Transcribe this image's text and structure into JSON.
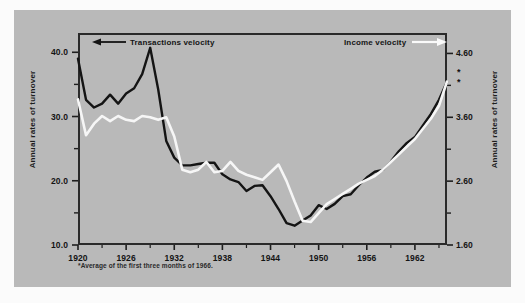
{
  "chart_data": {
    "type": "line",
    "title": "",
    "subtitle": "",
    "xlabel": "",
    "ylabel": "Annual rates of turnover",
    "ylabel_right": "Annual rates of turnover",
    "grid": false,
    "legend_position": "top",
    "xlim": [
      1920,
      1966
    ],
    "xticks": [
      1920,
      1926,
      1932,
      1938,
      1944,
      1950,
      1956,
      1962
    ],
    "xtick_labels": [
      "1920",
      "1926",
      "1932",
      "1938",
      "1944",
      "1950",
      "1956",
      "1962"
    ],
    "ylim_left": [
      10.0,
      43.0
    ],
    "yticks_left": [
      10.0,
      20.0,
      30.0,
      40.0
    ],
    "ytick_labels_left": [
      "10.0",
      "20.0",
      "30.0",
      "40.0"
    ],
    "yminor_left": [
      15.0,
      25.0,
      35.0
    ],
    "ylim_right": [
      1.6,
      4.92
    ],
    "yticks_right": [
      1.6,
      2.6,
      3.6,
      4.6
    ],
    "ytick_labels_right": [
      "1.60",
      "2.60",
      "3.60",
      "4.60"
    ],
    "yminor_right": [
      2.1,
      3.1,
      4.1
    ],
    "footnote": "*Average of the first three months of 1966.",
    "series": [
      {
        "name": "Transactions velocity",
        "color": "#141414",
        "axis": "left",
        "arrow": "left",
        "x": [
          1920,
          1921,
          1922,
          1923,
          1924,
          1925,
          1926,
          1927,
          1928,
          1929,
          1930,
          1931,
          1932,
          1933,
          1934,
          1935,
          1936,
          1937,
          1938,
          1939,
          1940,
          1941,
          1942,
          1943,
          1944,
          1945,
          1946,
          1947,
          1948,
          1949,
          1950,
          1951,
          1952,
          1953,
          1954,
          1955,
          1956,
          1957,
          1958,
          1959,
          1960,
          1961,
          1962,
          1963,
          1964,
          1965,
          1966
        ],
        "values": [
          39.0,
          32.6,
          31.4,
          32.0,
          33.4,
          32.0,
          33.6,
          34.4,
          36.6,
          40.7,
          34.2,
          26.2,
          23.6,
          22.4,
          22.4,
          22.6,
          22.8,
          22.8,
          21.0,
          20.2,
          19.8,
          18.4,
          19.2,
          19.3,
          17.6,
          15.6,
          13.4,
          13.0,
          13.8,
          14.6,
          16.2,
          15.6,
          16.4,
          17.6,
          17.9,
          19.3,
          20.5,
          21.4,
          21.7,
          23.0,
          24.6,
          25.9,
          26.8,
          28.6,
          30.4,
          32.6,
          35.4
        ]
      },
      {
        "name": "Income velocity",
        "color": "#f6f6f6",
        "axis": "right",
        "arrow": "right",
        "x": [
          1920,
          1921,
          1922,
          1923,
          1924,
          1925,
          1926,
          1927,
          1928,
          1929,
          1930,
          1931,
          1932,
          1933,
          1934,
          1935,
          1936,
          1937,
          1938,
          1939,
          1940,
          1941,
          1942,
          1943,
          1944,
          1945,
          1946,
          1947,
          1948,
          1949,
          1950,
          1951,
          1952,
          1953,
          1954,
          1955,
          1956,
          1957,
          1958,
          1959,
          1960,
          1961,
          1962,
          1963,
          1964,
          1965,
          1966
        ],
        "values": [
          3.88,
          3.32,
          3.5,
          3.62,
          3.54,
          3.62,
          3.56,
          3.54,
          3.62,
          3.6,
          3.56,
          3.6,
          3.3,
          2.78,
          2.74,
          2.78,
          2.9,
          2.74,
          2.76,
          2.9,
          2.76,
          2.7,
          2.66,
          2.62,
          2.74,
          2.86,
          2.6,
          2.28,
          1.98,
          1.96,
          2.1,
          2.24,
          2.32,
          2.4,
          2.48,
          2.56,
          2.62,
          2.68,
          2.78,
          2.9,
          3.02,
          3.14,
          3.26,
          3.42,
          3.58,
          3.78,
          4.16
        ]
      }
    ],
    "annotations": [
      {
        "text": "*",
        "axis": "right",
        "near_value": 4.28
      },
      {
        "text": "*",
        "axis": "right",
        "near_value": 4.12
      }
    ]
  },
  "legend": {
    "left_label": "Transactions velocity",
    "right_label": "Income velocity"
  },
  "asterisks": {
    "upper": "*",
    "lower": "*"
  }
}
